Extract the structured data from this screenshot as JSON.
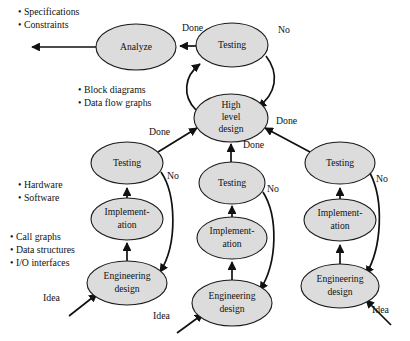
{
  "diagram": {
    "colors": {
      "node_fill": "#dcdcdc",
      "node_stroke": "#1a1a1a",
      "edge": "#111111",
      "background": "#ffffff"
    },
    "nodes": [
      {
        "id": "analyze",
        "label_lines": [
          "Analyze"
        ],
        "cx": 136,
        "cy": 47,
        "rx": 40,
        "ry": 23
      },
      {
        "id": "testing_top",
        "label_lines": [
          "Testing"
        ],
        "cx": 232,
        "cy": 45,
        "rx": 36,
        "ry": 22
      },
      {
        "id": "hld",
        "label_lines": [
          "High",
          "level",
          "design"
        ],
        "cx": 231,
        "cy": 118,
        "rx": 37,
        "ry": 24
      },
      {
        "id": "testing_l",
        "label_lines": [
          "Testing"
        ],
        "cx": 127,
        "cy": 163,
        "rx": 36,
        "ry": 21
      },
      {
        "id": "impl_l",
        "label_lines": [
          "Implement-",
          "ation"
        ],
        "cx": 127,
        "cy": 219,
        "rx": 36,
        "ry": 21
      },
      {
        "id": "engdes_l",
        "label_lines": [
          "Engineering",
          "design"
        ],
        "cx": 127,
        "cy": 283,
        "rx": 40,
        "ry": 22
      },
      {
        "id": "testing_c",
        "label_lines": [
          "Testing"
        ],
        "cx": 232,
        "cy": 183,
        "rx": 33,
        "ry": 21
      },
      {
        "id": "impl_c",
        "label_lines": [
          "Implement-",
          "ation"
        ],
        "cx": 232,
        "cy": 238,
        "rx": 35,
        "ry": 21
      },
      {
        "id": "engdes_c",
        "label_lines": [
          "Engineering",
          "design"
        ],
        "cx": 232,
        "cy": 303,
        "rx": 40,
        "ry": 23
      },
      {
        "id": "testing_r",
        "label_lines": [
          "Testing"
        ],
        "cx": 340,
        "cy": 163,
        "rx": 35,
        "ry": 21
      },
      {
        "id": "impl_r",
        "label_lines": [
          "Implement-",
          "ation"
        ],
        "cx": 340,
        "cy": 220,
        "rx": 36,
        "ry": 21
      },
      {
        "id": "engdes_r",
        "label_lines": [
          "Engineering",
          "design"
        ],
        "cx": 340,
        "cy": 286,
        "rx": 39,
        "ry": 22
      }
    ],
    "edge_labels": [
      {
        "id": "done-top",
        "text": "Done",
        "x": 182,
        "y": 29
      },
      {
        "id": "no-top",
        "text": "No",
        "x": 278,
        "y": 31
      },
      {
        "id": "done-hld-r",
        "text": "Done",
        "x": 276,
        "y": 122
      },
      {
        "id": "done-left",
        "text": "Done",
        "x": 149,
        "y": 133
      },
      {
        "id": "no-left",
        "text": "No",
        "x": 167,
        "y": 177
      },
      {
        "id": "done-center",
        "text": "Done",
        "x": 243,
        "y": 146
      },
      {
        "id": "no-center",
        "text": "No",
        "x": 267,
        "y": 190
      },
      {
        "id": "no-right",
        "text": "No",
        "x": 376,
        "y": 180
      },
      {
        "id": "idea-left",
        "text": "Idea",
        "x": 43,
        "y": 299
      },
      {
        "id": "idea-center",
        "text": "Idea",
        "x": 153,
        "y": 317
      },
      {
        "id": "idea-right",
        "text": "Idea",
        "x": 372,
        "y": 311
      }
    ],
    "annotations": [
      {
        "id": "analyze-outputs",
        "items": [
          "Specifications",
          "Constraints"
        ],
        "x": 18,
        "y": 13,
        "line_height": 13
      },
      {
        "id": "hld-outputs",
        "items": [
          "Block diagrams",
          "Data flow graphs"
        ],
        "x": 78,
        "y": 91,
        "line_height": 13
      },
      {
        "id": "impl-outputs",
        "items": [
          "Hardware",
          "Software"
        ],
        "x": 18,
        "y": 186,
        "line_height": 13
      },
      {
        "id": "engdes-outputs",
        "items": [
          "Call graphs",
          "Data structures",
          "I/O interfaces"
        ],
        "x": 10,
        "y": 238,
        "line_height": 13
      }
    ]
  }
}
